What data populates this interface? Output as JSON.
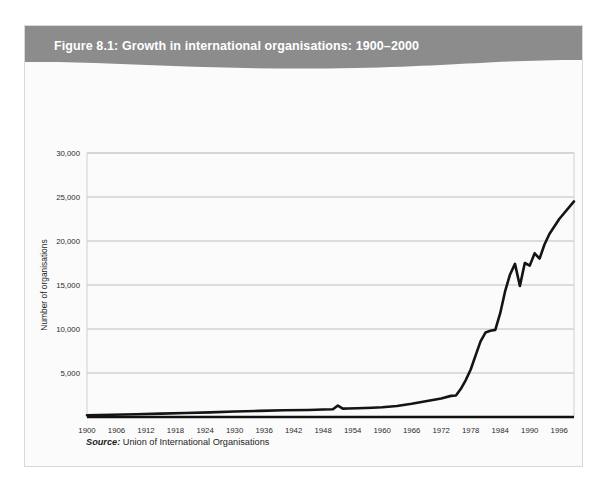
{
  "figure": {
    "title": "Figure 8.1: Growth in international organisations: 1900–2000",
    "header_color": "#8c8c8c",
    "panel_color": "#fbfbfb",
    "source_label": "Source:",
    "source_text": " Union of International Organisations"
  },
  "chart_data": {
    "type": "line",
    "title": "Figure 8.1: Growth in international organisations: 1900–2000",
    "xlabel": "",
    "ylabel": "Number of organisations",
    "xlim": [
      1900,
      1999
    ],
    "ylim": [
      0,
      30000
    ],
    "grid": true,
    "legend": null,
    "line_color": "#141414",
    "ytick_labels": [
      "5,000",
      "10,000",
      "15,000",
      "20,000",
      "25,000",
      "30,000"
    ],
    "yticks": [
      5000,
      10000,
      15000,
      20000,
      25000,
      30000
    ],
    "xtick_labels": [
      "1900",
      "1906",
      "1912",
      "1918",
      "1924",
      "1930",
      "1936",
      "1942",
      "1948",
      "1954",
      "1960",
      "1966",
      "1972",
      "1978",
      "1984",
      "1990",
      "1996"
    ],
    "xticks": [
      1900,
      1906,
      1912,
      1918,
      1924,
      1930,
      1936,
      1942,
      1948,
      1954,
      1960,
      1966,
      1972,
      1978,
      1984,
      1990,
      1996
    ],
    "series": [
      {
        "name": "Number of international organisations",
        "x": [
          1900,
          1905,
          1910,
          1915,
          1920,
          1925,
          1930,
          1935,
          1940,
          1945,
          1948,
          1950,
          1951,
          1952,
          1953,
          1955,
          1958,
          1960,
          1963,
          1966,
          1968,
          1970,
          1972,
          1974,
          1975,
          1976,
          1977,
          1978,
          1979,
          1980,
          1981,
          1982,
          1983,
          1984,
          1985,
          1986,
          1987,
          1988,
          1989,
          1990,
          1991,
          1992,
          1993,
          1994,
          1996,
          1999
        ],
        "y": [
          200,
          250,
          320,
          380,
          450,
          520,
          620,
          700,
          760,
          800,
          850,
          880,
          1300,
          950,
          960,
          1000,
          1050,
          1100,
          1250,
          1500,
          1700,
          1900,
          2100,
          2400,
          2450,
          3200,
          4200,
          5400,
          7000,
          8600,
          9600,
          9800,
          9900,
          11800,
          14300,
          16200,
          17400,
          14900,
          17500,
          17200,
          18600,
          18000,
          19600,
          20800,
          22500,
          24500
        ]
      }
    ]
  }
}
